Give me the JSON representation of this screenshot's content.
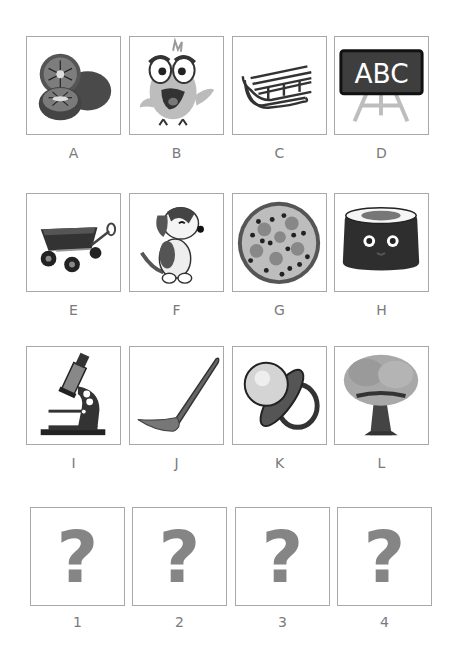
{
  "puzzle": {
    "picture_cards": [
      {
        "label": "A",
        "icon": "kiwi-fruit-icon"
      },
      {
        "label": "B",
        "icon": "cartoon-bird-icon"
      },
      {
        "label": "C",
        "icon": "sled-icon"
      },
      {
        "label": "D",
        "icon": "chalkboard-icon",
        "text": "ABC"
      },
      {
        "label": "E",
        "icon": "wagon-icon"
      },
      {
        "label": "F",
        "icon": "puppy-icon"
      },
      {
        "label": "G",
        "icon": "pizza-icon"
      },
      {
        "label": "H",
        "icon": "sushi-roll-icon"
      },
      {
        "label": "I",
        "icon": "microscope-icon"
      },
      {
        "label": "J",
        "icon": "spoon-icon"
      },
      {
        "label": "K",
        "icon": "pacifier-icon"
      },
      {
        "label": "L",
        "icon": "tree-icon"
      }
    ],
    "answer_slots": [
      {
        "label": "1",
        "placeholder": "?"
      },
      {
        "label": "2",
        "placeholder": "?"
      },
      {
        "label": "3",
        "placeholder": "?"
      },
      {
        "label": "4",
        "placeholder": "?"
      }
    ]
  },
  "colors": {
    "border": "#a8a8a8",
    "label": "#7a7a7a",
    "question_mark": "#858585"
  }
}
